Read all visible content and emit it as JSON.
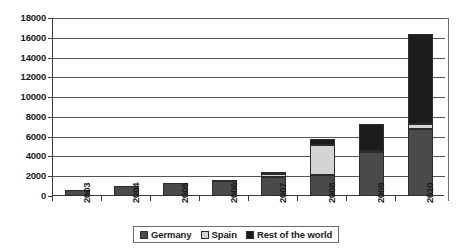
{
  "chart_data": {
    "type": "bar",
    "subtype": "stacked-column",
    "title": "",
    "xlabel": "",
    "ylabel": "",
    "categories": [
      "2003",
      "2004",
      "2005",
      "2006",
      "2007",
      "2008",
      "2009",
      "2010"
    ],
    "series": [
      {
        "name": "Germany",
        "color": "#4a4a4a",
        "values": [
          600,
          1050,
          1300,
          1500,
          1900,
          2100,
          4400,
          6800
        ]
      },
      {
        "name": "Spain",
        "color": "#d4d4d4",
        "values": [
          0,
          0,
          0,
          0,
          350,
          3100,
          150,
          500
        ]
      },
      {
        "name": "Rest of the world",
        "color": "#1c1c1c",
        "values": [
          0,
          0,
          0,
          100,
          150,
          600,
          2750,
          9100
        ]
      }
    ],
    "totals": [
      600,
      1050,
      1300,
      1600,
      2400,
      5800,
      7300,
      16400
    ],
    "ylim": [
      0,
      18000
    ],
    "ytick_step": 2000,
    "yticks": [
      0,
      2000,
      4000,
      6000,
      8000,
      10000,
      12000,
      14000,
      16000,
      18000
    ],
    "ytick_labels": [
      "0",
      "2000",
      "4000",
      "6000",
      "8000",
      "10000",
      "12000",
      "14000",
      "16000",
      "18000"
    ],
    "grid": true,
    "grid_axis": "y",
    "legend_position": "bottom",
    "legend_entries": [
      "Germany",
      "Spain",
      "Rest of the world"
    ]
  },
  "colors": {
    "germany": "#4a4a4a",
    "spain": "#d4d4d4",
    "rest_of_world": "#1c1c1c",
    "axis": "#3a3a3a",
    "gridline": "#555555",
    "frame": "#6b6b6b",
    "background": "#ffffff",
    "text": "#1a1a1a"
  }
}
